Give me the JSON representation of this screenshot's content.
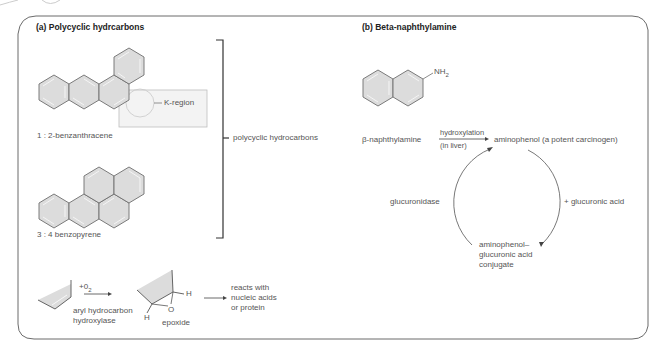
{
  "panels": {
    "a": {
      "title": "(a) Polycyclic hydrcarbons",
      "compound1_label": "1 : 2-benzanthracene",
      "k_region_label": "K-region",
      "compound2_label": "3 : 4 benzopyrene",
      "bracket_label": "polycyclic hydrocarbons",
      "reaction": {
        "reagent_prefix": "+0",
        "reagent_sub": "2",
        "enzyme_line1": "aryl hydrocarbon",
        "enzyme_line2": "hydroxylase",
        "h_top": "H",
        "h_bottom": "H",
        "oxygen": "O",
        "product_label": "epoxide",
        "outcome_line1": "reacts with",
        "outcome_line2": "nucleic acids",
        "outcome_line3": "or protein"
      }
    },
    "b": {
      "title": "(b) Beta-naphthylamine",
      "nh2_main": "NH",
      "nh2_sub": "2",
      "substrate": "β-naphthylamine",
      "step_above": "hydroxylation",
      "step_below": "(in liver)",
      "product": "aminophenol (a potent carcinogen)",
      "cycle_left": "glucuronidase",
      "cycle_right": "+ glucuronic acid",
      "conjugate_line1": "aminophenol–",
      "conjugate_line2": "glucuronic acid",
      "conjugate_line3": "conjugate"
    }
  },
  "colors": {
    "border": "#6b6b6b",
    "ring_fill": "#dcdcdc",
    "ring_stroke": "#6e6e6e",
    "k_box_fill": "#f3f3f3",
    "text": "#555555",
    "title": "#222222"
  }
}
